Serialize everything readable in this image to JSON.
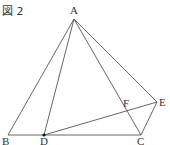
{
  "figure": {
    "title": "図 2",
    "points": {
      "A": {
        "label": "A"
      },
      "B": {
        "label": "B"
      },
      "C": {
        "label": "C"
      },
      "D": {
        "label": "D"
      },
      "E": {
        "label": "E"
      },
      "F": {
        "label": "F"
      }
    },
    "segments": [
      "AB",
      "AD",
      "AC",
      "AE",
      "BC",
      "DE",
      "CE"
    ],
    "marked_points": [
      "D"
    ],
    "line_color": "#555555"
  }
}
